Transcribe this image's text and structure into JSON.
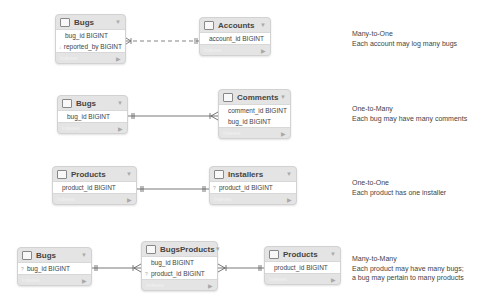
{
  "relationships": [
    {
      "id": "many-to-one",
      "title": "Many-to-One",
      "description": [
        "Each account may log many bugs"
      ],
      "tables": [
        {
          "name": "Bugs",
          "fields": [
            {
              "key": "",
              "label": "bug_id BIGINT"
            },
            {
              "key": "↓",
              "label": "reported_by BIGINT"
            }
          ],
          "footer": "Indexes"
        },
        {
          "name": "Accounts",
          "fields": [
            {
              "key": "",
              "label": "account_id BIGINT"
            }
          ],
          "footer": "Indexes"
        }
      ],
      "line_style": "dashed"
    },
    {
      "id": "one-to-many",
      "title": "One-to-Many",
      "description": [
        "Each bug may have many comments"
      ],
      "tables": [
        {
          "name": "Bugs",
          "fields": [
            {
              "key": "",
              "label": "bug_id BIGINT"
            }
          ],
          "footer": "Indexes"
        },
        {
          "name": "Comments",
          "fields": [
            {
              "key": "",
              "label": "comment_id BIGINT"
            },
            {
              "key": "",
              "label": "bug_id BIGINT"
            }
          ],
          "footer": "Indexes"
        }
      ],
      "line_style": "solid"
    },
    {
      "id": "one-to-one",
      "title": "One-to-One",
      "description": [
        "Each product has one installer"
      ],
      "tables": [
        {
          "name": "Products",
          "fields": [
            {
              "key": "",
              "label": "product_id BIGINT"
            }
          ],
          "footer": "Indexes"
        },
        {
          "name": "Installers",
          "fields": [
            {
              "key": "?",
              "label": "product_id BIGINT"
            }
          ],
          "footer": "Indexes"
        }
      ],
      "line_style": "solid"
    },
    {
      "id": "many-to-many",
      "title": "Many-to-Many",
      "description": [
        "Each product may have many bugs;",
        "a bug may pertain to many products"
      ],
      "tables": [
        {
          "name": "Bugs",
          "fields": [
            {
              "key": "?",
              "label": "bug_id BIGINT"
            }
          ],
          "footer": "Indexes"
        },
        {
          "name": "BugsProducts",
          "fields": [
            {
              "key": "",
              "label": "bug_id BIGINT"
            },
            {
              "key": "?",
              "label": "product_id BIGINT"
            }
          ],
          "footer": "Indexes"
        },
        {
          "name": "Products",
          "fields": [
            {
              "key": "",
              "label": "product_id BIGINT"
            }
          ],
          "footer": "Indexes"
        }
      ],
      "line_style": "solid"
    }
  ],
  "icons": {
    "table": "table-icon",
    "menu": "▼",
    "expand": "▶"
  },
  "colors": {
    "table_bg": "#e4e4e4",
    "row_bg": "#ffffff",
    "line": "#555555",
    "text": "#444444"
  }
}
